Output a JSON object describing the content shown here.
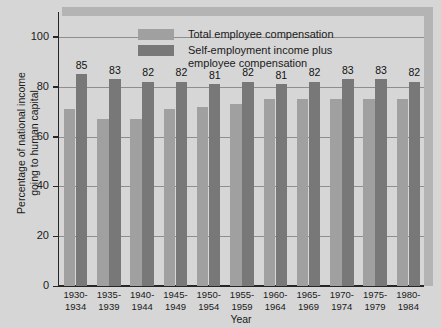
{
  "chart_data": {
    "type": "bar",
    "title": "",
    "xlabel": "Year",
    "ylabel": "Percentage of national income\ngoing to human capital",
    "ylim": [
      0,
      110
    ],
    "yticks": [
      0,
      20,
      40,
      60,
      80,
      100
    ],
    "ytick_labels": [
      "0",
      "20",
      "40",
      "60",
      "80",
      "100"
    ],
    "grid": true,
    "legend_position": "top-center",
    "categories": [
      "1930-\n1934",
      "1935-\n1939",
      "1940-\n1944",
      "1945-\n1949",
      "1950-\n1954",
      "1955-\n1959",
      "1960-\n1964",
      "1965-\n1969",
      "1970-\n1974",
      "1975-\n1979",
      "1980-\n1984"
    ],
    "series": [
      {
        "name": "Total employee compensation",
        "color": "#a0a0a0",
        "values": [
          71,
          67,
          67,
          71,
          72,
          73,
          75,
          75,
          75,
          75,
          75
        ],
        "labels_shown": false
      },
      {
        "name": "Self-employment income plus\nemployee compensation",
        "color": "#787878",
        "values": [
          85,
          83,
          82,
          82,
          81,
          82,
          81,
          82,
          83,
          83,
          82
        ],
        "labels_shown": true,
        "labels": [
          "85",
          "83",
          "82",
          "82",
          "81",
          "82",
          "81",
          "82",
          "83",
          "83",
          "82"
        ]
      }
    ]
  },
  "legend": {
    "items": [
      {
        "label": "Total employee compensation",
        "color": "#a0a0a0"
      },
      {
        "label": "Self-employment income plus\nemployee compensation",
        "color": "#787878"
      }
    ]
  },
  "axes": {
    "y_title": "Percentage of national income\ngoing to human capital",
    "x_title": "Year"
  },
  "colors": {
    "background": "#d6d6d6",
    "shadow": "#b4b4b4",
    "axis": "#262626",
    "gridline": "#8e8e8e",
    "series_light": "#a0a0a0",
    "series_dark": "#787878"
  }
}
